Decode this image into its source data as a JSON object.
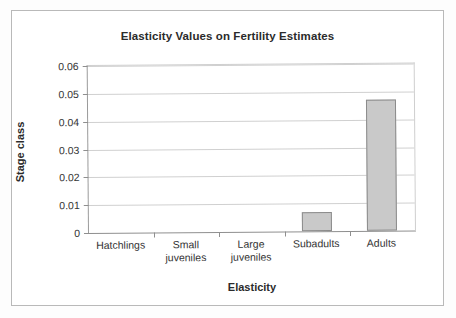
{
  "chart_data": {
    "type": "bar",
    "title": "Elasticity Values on Fertility Estimates",
    "xlabel": "Elasticity",
    "ylabel": "Stage class",
    "categories": [
      "Hatchlings",
      "Small juveniles",
      "Large juveniles",
      "Subadults",
      "Adults"
    ],
    "values": [
      0,
      0,
      0,
      0.007,
      0.047
    ],
    "ylim": [
      0,
      0.06
    ],
    "ytick_step": 0.01,
    "ytick_labels": [
      "0.06",
      "0.05",
      "0.04",
      "0.03",
      "0.02",
      "0.01",
      "0"
    ],
    "ytick_values": [
      0.06,
      0.05,
      0.04,
      0.03,
      0.02,
      0.01,
      0
    ],
    "grid": true,
    "legend": false,
    "bar_color": "#c9c9c9",
    "bar_border_color": "#8b8b8b",
    "axis_color": "#8f8f8f",
    "gridline_color": "#d0d0d0",
    "background": "#ffffff"
  },
  "categories_display": [
    {
      "lines": [
        "Hatchlings"
      ]
    },
    {
      "lines": [
        "Small",
        "juveniles"
      ]
    },
    {
      "lines": [
        "Large",
        "juveniles"
      ]
    },
    {
      "lines": [
        "Subadults"
      ]
    },
    {
      "lines": [
        "Adults"
      ]
    }
  ]
}
